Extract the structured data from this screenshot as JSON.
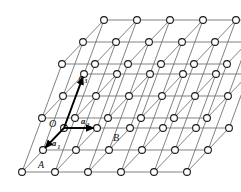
{
  "figure": {
    "type": "diagram",
    "background_color": "#ffffff",
    "line_color": "#6b6b6b",
    "node_stroke_color": "#1a1a1a",
    "node_fill_color": "#ffffff",
    "vector_color": "#000000",
    "width": 241,
    "height": 192
  },
  "labels": {
    "origin": "O",
    "point_a": "A",
    "point_b": "B",
    "vector1": "a",
    "vector1_sub": "1",
    "vector2": "a",
    "vector2_sub": "2",
    "vector3": "a",
    "vector3_sub": "3"
  },
  "lattice": {
    "rows": 8,
    "cols": 6,
    "row_spacing_px": 23,
    "col_spacing_px": 33,
    "row_shear_px": 16,
    "node_radius_px": 3.4,
    "node_count": 46
  },
  "chart_data": {
    "type": "scatter",
    "xlabel": "",
    "ylabel": "",
    "grid": true,
    "legend": "none",
    "annotations": [
      "O",
      "A",
      "B",
      "a1",
      "a2",
      "a3"
    ],
    "nodes": [
      {
        "row": 0,
        "col": 0,
        "x": 103,
        "y": 14
      },
      {
        "row": 0,
        "col": 1,
        "x": 136,
        "y": 14
      },
      {
        "row": 0,
        "col": 2,
        "x": 169,
        "y": 14
      },
      {
        "row": 0,
        "col": 3,
        "x": 202,
        "y": 14
      },
      {
        "row": 0,
        "col": 4,
        "x": 232,
        "y": 14
      },
      {
        "row": 1,
        "col": 0,
        "x": 82,
        "y": 40
      },
      {
        "row": 1,
        "col": 1,
        "x": 115,
        "y": 40
      },
      {
        "row": 1,
        "col": 2,
        "x": 148,
        "y": 40
      },
      {
        "row": 1,
        "col": 3,
        "x": 181,
        "y": 40
      },
      {
        "row": 1,
        "col": 4,
        "x": 214,
        "y": 40
      },
      {
        "row": 2,
        "col": 0,
        "x": 61,
        "y": 62
      },
      {
        "row": 2,
        "col": 1,
        "x": 94,
        "y": 62
      },
      {
        "row": 2,
        "col": 2,
        "x": 127,
        "y": 62
      },
      {
        "row": 2,
        "col": 3,
        "x": 160,
        "y": 62
      },
      {
        "row": 2,
        "col": 4,
        "x": 193,
        "y": 62
      },
      {
        "row": 3,
        "col": 0,
        "x": 84,
        "y": 74
      },
      {
        "row": 3,
        "col": 1,
        "x": 117,
        "y": 74
      },
      {
        "row": 3,
        "col": 2,
        "x": 150,
        "y": 74
      },
      {
        "row": 3,
        "col": 3,
        "x": 183,
        "y": 74
      },
      {
        "row": 3,
        "col": 4,
        "x": 216,
        "y": 74
      },
      {
        "row": 4,
        "col": 0,
        "x": 63,
        "y": 96
      },
      {
        "row": 4,
        "col": 1,
        "x": 96,
        "y": 96
      },
      {
        "row": 4,
        "col": 2,
        "x": 129,
        "y": 96
      },
      {
        "row": 4,
        "col": 3,
        "x": 162,
        "y": 96
      },
      {
        "row": 4,
        "col": 4,
        "x": 195,
        "y": 96
      },
      {
        "row": 5,
        "col": 0,
        "x": 42,
        "y": 118
      },
      {
        "row": 5,
        "col": 1,
        "x": 75,
        "y": 118
      },
      {
        "row": 5,
        "col": 2,
        "x": 108,
        "y": 118
      },
      {
        "row": 5,
        "col": 3,
        "x": 141,
        "y": 118
      },
      {
        "row": 5,
        "col": 4,
        "x": 174,
        "y": 118
      },
      {
        "row": 6,
        "col": 0,
        "x": 64,
        "y": 128
      },
      {
        "row": 6,
        "col": 1,
        "x": 97,
        "y": 128
      },
      {
        "row": 6,
        "col": 2,
        "x": 130,
        "y": 128
      },
      {
        "row": 6,
        "col": 3,
        "x": 163,
        "y": 128
      },
      {
        "row": 6,
        "col": 4,
        "x": 196,
        "y": 128
      },
      {
        "row": 7,
        "col": 0,
        "x": 43,
        "y": 150
      },
      {
        "row": 7,
        "col": 1,
        "x": 76,
        "y": 150
      },
      {
        "row": 7,
        "col": 2,
        "x": 109,
        "y": 150
      },
      {
        "row": 7,
        "col": 3,
        "x": 142,
        "y": 150
      },
      {
        "row": 7,
        "col": 4,
        "x": 175,
        "y": 150
      },
      {
        "row": 8,
        "col": 0,
        "x": 22,
        "y": 176
      },
      {
        "row": 8,
        "col": 1,
        "x": 55,
        "y": 176
      },
      {
        "row": 8,
        "col": 2,
        "x": 88,
        "y": 176
      },
      {
        "row": 8,
        "col": 3,
        "x": 121,
        "y": 176
      },
      {
        "row": 8,
        "col": 4,
        "x": 154,
        "y": 176
      },
      {
        "row": 8,
        "col": 5,
        "x": 187,
        "y": 176
      }
    ],
    "vectors": [
      {
        "name": "a1",
        "from": [
          64,
          128
        ],
        "to": [
          43,
          150
        ],
        "label_x": 52,
        "label_y": 143
      },
      {
        "name": "a2",
        "from": [
          64,
          128
        ],
        "to": [
          97,
          128
        ],
        "label_x": 80,
        "label_y": 123
      },
      {
        "name": "a3",
        "from": [
          64,
          128
        ],
        "to": [
          84,
          74
        ],
        "label_x": 79,
        "label_y": 78
      }
    ]
  }
}
